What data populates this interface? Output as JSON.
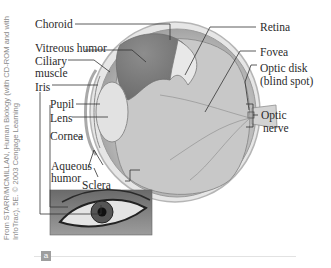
{
  "figure": {
    "panel_label": "a",
    "credit": "From STARR/MCMILLAN, Human Biology (with CD-ROM and with InfoTrac), 5E. © 2003 Cengage Learning",
    "labels_left": {
      "choroid": "Choroid",
      "vitreous_humor": "Vitreous humor",
      "ciliary_muscle_1": "Ciliary",
      "ciliary_muscle_2": "muscle",
      "iris": "Iris",
      "pupil": "Pupil",
      "lens": "Lens",
      "cornea": "Cornea",
      "aqueous_humor_1": "Aqueous",
      "aqueous_humor_2": "humor",
      "sclera": "Sclera"
    },
    "labels_right": {
      "retina": "Retina",
      "fovea": "Fovea",
      "optic_disk_1": "Optic disk",
      "optic_disk_2": "(blind spot)",
      "optic_nerve_1": "Optic",
      "optic_nerve_2": "nerve"
    }
  }
}
